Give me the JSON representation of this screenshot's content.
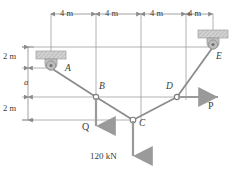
{
  "figure": {
    "colors": {
      "line": "#8a8a8a",
      "cable": "#7a7a7a",
      "arrow": "#9a9a9a",
      "text": "#3a3a3a",
      "support_fill": "#cfcfcf",
      "support_edge": "#9a9a9a",
      "pin_fill": "#b0b0b0",
      "background": "#ffffff"
    }
  },
  "top_dimensions": {
    "labels": [
      "4 m",
      "4 m",
      "4 m",
      "4 m"
    ]
  },
  "left_dimensions": {
    "labels": [
      "2 m",
      "a",
      "2 m"
    ]
  },
  "nodes": [
    {
      "id": "A",
      "label": "A",
      "type": "pin-support",
      "x": 51,
      "y": 68
    },
    {
      "id": "B",
      "label": "B",
      "type": "joint",
      "x": 96,
      "y": 97
    },
    {
      "id": "C",
      "label": "C",
      "type": "joint",
      "x": 133,
      "y": 120
    },
    {
      "id": "D",
      "label": "D",
      "type": "joint",
      "x": 177,
      "y": 97
    },
    {
      "id": "E",
      "label": "E",
      "type": "pin-support",
      "x": 213,
      "y": 47
    }
  ],
  "loads": [
    {
      "id": "Q",
      "label": "Q",
      "at": "B",
      "direction": "down"
    },
    {
      "id": "C120",
      "label": "120 kN",
      "at": "C",
      "direction": "down"
    },
    {
      "id": "P",
      "label": "P",
      "at": "D",
      "direction": "right"
    }
  ]
}
